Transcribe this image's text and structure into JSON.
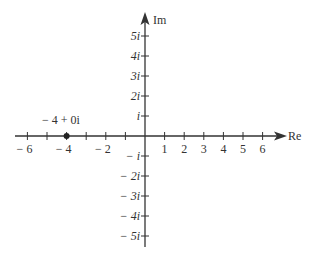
{
  "diagram": {
    "axes": {
      "real_label": "Re",
      "imag_label": "Im",
      "real_ticks": [
        {
          "value": -6,
          "label": "− 6"
        },
        {
          "value": -5,
          "label": ""
        },
        {
          "value": -4,
          "label": "− 4"
        },
        {
          "value": -3,
          "label": ""
        },
        {
          "value": -2,
          "label": "− 2"
        },
        {
          "value": -1,
          "label": ""
        },
        {
          "value": 1,
          "label": "1"
        },
        {
          "value": 2,
          "label": "2"
        },
        {
          "value": 3,
          "label": "3"
        },
        {
          "value": 4,
          "label": "4"
        },
        {
          "value": 5,
          "label": "5"
        },
        {
          "value": 6,
          "label": "6"
        }
      ],
      "imag_ticks": [
        {
          "value": 5,
          "label": "5i"
        },
        {
          "value": 4,
          "label": "4i"
        },
        {
          "value": 3,
          "label": "3i"
        },
        {
          "value": 2,
          "label": "2i"
        },
        {
          "value": 1,
          "label": "i"
        },
        {
          "value": -1,
          "label": "− i"
        },
        {
          "value": -2,
          "label": "− 2i"
        },
        {
          "value": -3,
          "label": "− 3i"
        },
        {
          "value": -4,
          "label": "− 4i"
        },
        {
          "value": -5,
          "label": "− 5i"
        }
      ]
    },
    "point": {
      "re": -4,
      "im": 0,
      "label": "− 4 + 0i"
    },
    "colors": {
      "ink": "#333333",
      "background": "#ffffff"
    }
  }
}
